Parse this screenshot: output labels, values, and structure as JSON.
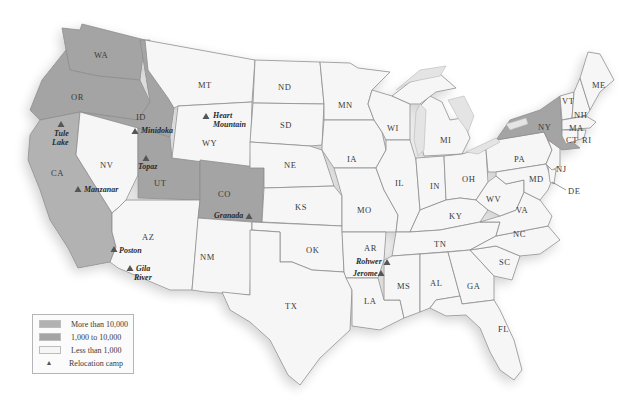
{
  "map": {
    "colors": {
      "more_than_10000": "#b2b2b2",
      "between_1000_10000": "#a4a4a4",
      "less_than_1000": "#f6f6f6",
      "camp_marker": "#555555"
    },
    "states": {
      "WA": "WA",
      "OR": "OR",
      "CA": "CA",
      "ID": "ID",
      "NV": "NV",
      "UT": "UT",
      "AZ": "AZ",
      "MT": "MT",
      "WY": "WY",
      "CO": "CO",
      "NM": "NM",
      "ND": "ND",
      "SD": "SD",
      "NE": "NE",
      "KS": "KS",
      "OK": "OK",
      "TX": "TX",
      "MN": "MN",
      "IA": "IA",
      "MO": "MO",
      "AR": "AR",
      "LA": "LA",
      "WI": "WI",
      "IL": "IL",
      "MI": "MI",
      "IN": "IN",
      "OH": "OH",
      "KY": "KY",
      "TN": "TN",
      "MS": "MS",
      "AL": "AL",
      "GA": "GA",
      "FL": "FL",
      "SC": "SC",
      "NC": "NC",
      "VA": "VA",
      "WV": "WV",
      "PA": "PA",
      "NY": "NY",
      "MD": "MD",
      "DE": "DE",
      "NJ": "NJ",
      "VT": "VT",
      "NH": "NH",
      "ME": "ME",
      "MA": "MA",
      "CT": "CT",
      "RI": "RI"
    },
    "camps": {
      "tule_lake_1": "Tule",
      "tule_lake_2": "Lake",
      "minidoka": "Minidoka",
      "heart_mountain_1": "Heart",
      "heart_mountain_2": "Mountain",
      "topaz": "Topaz",
      "manzanar": "Manzanar",
      "granada": "Granada",
      "poston": "Poston",
      "gila_river_1": "Gila",
      "gila_river_2": "River",
      "rohwer": "Rohwer",
      "jerome": "Jerome"
    }
  },
  "legend": {
    "items": [
      {
        "label": "More than 10,000",
        "color": "#b2b2b2"
      },
      {
        "label": "1,000 to 10,000",
        "color": "#a4a4a4"
      },
      {
        "label": "Less than 1,000",
        "color": "#f6f6f6"
      },
      {
        "label": "Relocation camp",
        "symbol": "▲"
      }
    ]
  }
}
